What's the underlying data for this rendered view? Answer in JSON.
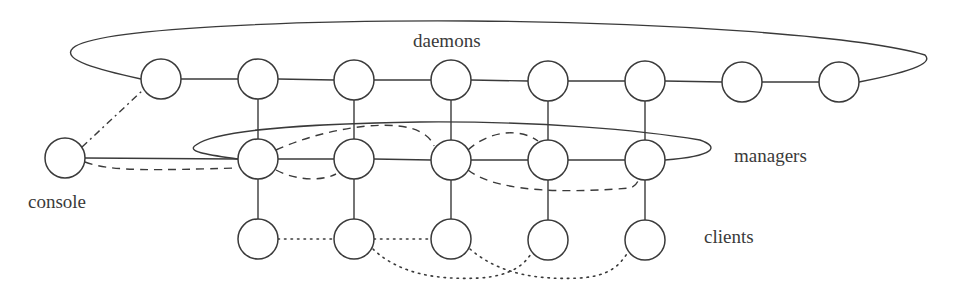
{
  "labels": {
    "daemons": "daemons",
    "managers": "managers",
    "console": "console",
    "clients": "clients"
  },
  "colors": {
    "stroke": "#3a3a3a",
    "background": "#ffffff"
  },
  "nodes": {
    "radius": 20,
    "console": {
      "x": 65,
      "y": 158
    },
    "daemons": [
      {
        "x": 161,
        "y": 79
      },
      {
        "x": 258,
        "y": 79
      },
      {
        "x": 354,
        "y": 80
      },
      {
        "x": 451,
        "y": 80
      },
      {
        "x": 548,
        "y": 81
      },
      {
        "x": 645,
        "y": 81
      },
      {
        "x": 742,
        "y": 82
      },
      {
        "x": 839,
        "y": 82
      }
    ],
    "managers": [
      {
        "x": 258,
        "y": 159
      },
      {
        "x": 354,
        "y": 159
      },
      {
        "x": 451,
        "y": 160
      },
      {
        "x": 548,
        "y": 160
      },
      {
        "x": 645,
        "y": 160
      }
    ],
    "clients": [
      {
        "x": 258,
        "y": 239
      },
      {
        "x": 354,
        "y": 239
      },
      {
        "x": 451,
        "y": 239
      },
      {
        "x": 548,
        "y": 240
      },
      {
        "x": 645,
        "y": 240
      }
    ]
  },
  "edges": {
    "solid": "daemon chain, daemon-manager verticals, manager chain, manager-client verticals, console-manager1",
    "dash_dot": "console to daemon1",
    "dashed": [
      "console-manager1",
      "manager1-manager3",
      "manager1-manager2",
      "manager3-manager4",
      "manager3-manager5"
    ],
    "dotted": [
      "client1-client2",
      "client2-client3",
      "client2-client4",
      "client3-client5"
    ]
  }
}
